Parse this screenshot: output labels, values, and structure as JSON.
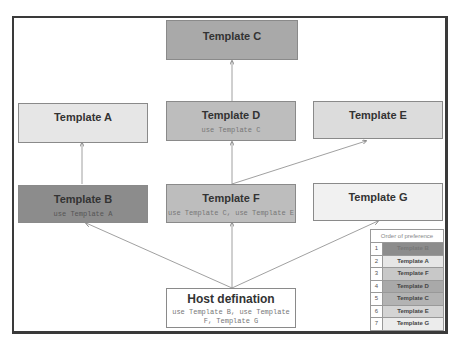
{
  "colors": {
    "dark": "#8c8c8c",
    "mid": "#a9a9a9",
    "midlight": "#bdbdbd",
    "light": "#dcdcdc",
    "lighter": "#e6e6e6",
    "lightest": "#f1f1f1",
    "frame": "#3a3a3a"
  },
  "nodes": {
    "c": {
      "title": "Template C",
      "sub": ""
    },
    "a": {
      "title": "Template A",
      "sub": ""
    },
    "d": {
      "title": "Template D",
      "sub": "use Template C"
    },
    "e": {
      "title": "Template E",
      "sub": ""
    },
    "b": {
      "title": "Template B",
      "sub": "use Template A"
    },
    "f": {
      "title": "Template F",
      "sub": "use Template C, use Template E"
    },
    "g": {
      "title": "Template G",
      "sub": ""
    },
    "host": {
      "title": "Host defination",
      "sub": "use Template B, use Template F, Template G"
    }
  },
  "legend": {
    "title": "Order of preference",
    "rows": [
      {
        "num": "1",
        "label": "Template B"
      },
      {
        "num": "2",
        "label": "Template A"
      },
      {
        "num": "3",
        "label": "Template F"
      },
      {
        "num": "4",
        "label": "Template D"
      },
      {
        "num": "5",
        "label": "Template C"
      },
      {
        "num": "6",
        "label": "Template E"
      },
      {
        "num": "7",
        "label": "Template G"
      }
    ]
  }
}
